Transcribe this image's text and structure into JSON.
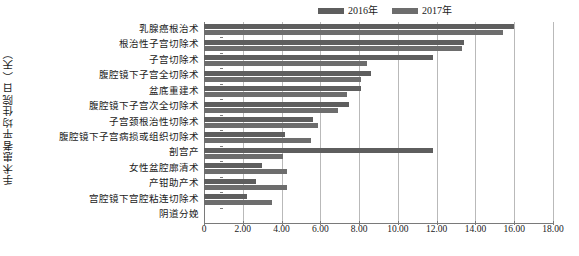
{
  "chart_data": {
    "type": "bar",
    "orientation": "horizontal",
    "title": "",
    "xlabel": "",
    "ylabel": "手术患者平均住院日（天）",
    "xlim": [
      0,
      18
    ],
    "xticks": [
      "0",
      "2.00",
      "4.00",
      "6.00",
      "8.00",
      "10.00",
      "12.00",
      "14.00",
      "16.00",
      "18.00"
    ],
    "xtick_values": [
      0,
      2,
      4,
      6,
      8,
      10,
      12,
      14,
      16,
      18
    ],
    "grid": true,
    "legend_position": "top-right",
    "categories": [
      "乳腺癌根治术",
      "根治性子宫切除术",
      "子宫切除术",
      "腹腔镜下子宫全切除术",
      "盆底重建术",
      "腹腔镜下子宫次全切除术",
      "子宫颈根治性切除术",
      "腹腔镜下子宫病损或组织切除术",
      "剖宫产",
      "女性盆腔廓清术",
      "产钳助产术",
      "宫腔镜下宫腔粘连切除术",
      "阴道分娩"
    ],
    "series": [
      {
        "name": "2016年",
        "color": "#5e5e5e",
        "values": [
          16.0,
          13.4,
          11.8,
          8.6,
          8.1,
          7.5,
          5.6,
          4.2,
          11.8,
          3.0,
          2.7,
          2.2,
          0.0
        ]
      },
      {
        "name": "2017年",
        "color": "#6d6d6d",
        "values": [
          15.4,
          13.3,
          8.4,
          8.1,
          7.4,
          6.9,
          5.9,
          5.5,
          4.1,
          4.3,
          4.3,
          3.5,
          0.0
        ]
      }
    ]
  },
  "legend": {
    "items": [
      {
        "label": "2016年",
        "color": "#5e5e5e"
      },
      {
        "label": "2017年",
        "color": "#6d6d6d"
      }
    ]
  },
  "axes": {
    "y_title": "手术患者平均住院日（天）"
  }
}
